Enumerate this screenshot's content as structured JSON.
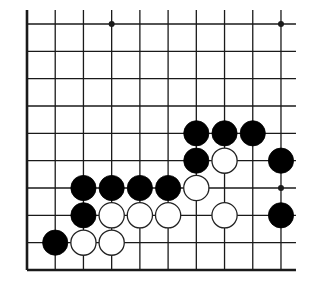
{
  "diagram": {
    "type": "go-board-fragment",
    "columns": 10,
    "rows": 10,
    "edges": {
      "left": true,
      "bottom": true,
      "top": false,
      "right": false
    },
    "colors": {
      "line": "#1a1a1a",
      "black_stone": "#000000",
      "white_stone": "#ffffff",
      "background": "#ffffff"
    },
    "star_points": [
      [
        3,
        0
      ],
      [
        9,
        0
      ],
      [
        9,
        6
      ]
    ],
    "stones": [
      {
        "col": 6,
        "row": 4,
        "color": "black"
      },
      {
        "col": 7,
        "row": 4,
        "color": "black"
      },
      {
        "col": 8,
        "row": 4,
        "color": "black"
      },
      {
        "col": 6,
        "row": 5,
        "color": "black"
      },
      {
        "col": 7,
        "row": 5,
        "color": "white"
      },
      {
        "col": 9,
        "row": 5,
        "color": "black"
      },
      {
        "col": 2,
        "row": 6,
        "color": "black"
      },
      {
        "col": 3,
        "row": 6,
        "color": "black"
      },
      {
        "col": 4,
        "row": 6,
        "color": "black"
      },
      {
        "col": 5,
        "row": 6,
        "color": "black"
      },
      {
        "col": 6,
        "row": 6,
        "color": "white"
      },
      {
        "col": 2,
        "row": 7,
        "color": "black"
      },
      {
        "col": 3,
        "row": 7,
        "color": "white"
      },
      {
        "col": 4,
        "row": 7,
        "color": "white"
      },
      {
        "col": 5,
        "row": 7,
        "color": "white"
      },
      {
        "col": 7,
        "row": 7,
        "color": "white"
      },
      {
        "col": 9,
        "row": 7,
        "color": "black"
      },
      {
        "col": 1,
        "row": 8,
        "color": "black"
      },
      {
        "col": 2,
        "row": 8,
        "color": "white"
      },
      {
        "col": 3,
        "row": 8,
        "color": "white"
      }
    ]
  }
}
